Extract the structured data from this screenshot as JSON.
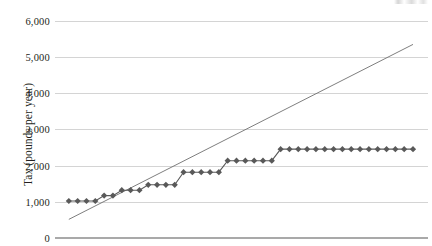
{
  "chart_data": {
    "type": "scatter",
    "title": "",
    "xlabel": "",
    "ylabel": "Tax (pounds per year)",
    "ylim": [
      0,
      6000
    ],
    "xlim": [
      0,
      40
    ],
    "grid": true,
    "legend": "none",
    "y_ticks": [
      "0",
      "1,000",
      "2,000",
      "3,000",
      "4,000",
      "5,000",
      "6,000"
    ],
    "y_tick_values": [
      0,
      1000,
      2000,
      3000,
      4000,
      5000,
      6000
    ],
    "x_ticks": [],
    "series": [
      {
        "name": "Tax paid (stepped bands)",
        "marker": "diamond",
        "color": "#595959",
        "x": [
          1,
          2,
          3,
          4,
          5,
          6,
          7,
          8,
          9,
          10,
          11,
          12,
          13,
          14,
          15,
          16,
          17,
          18,
          19,
          20,
          21,
          22,
          23,
          24,
          25,
          26,
          27,
          28,
          29,
          30,
          31,
          32,
          33,
          34,
          35,
          36,
          37,
          38,
          39,
          40
        ],
        "values": [
          1000,
          1000,
          1000,
          1000,
          1150,
          1150,
          1300,
          1300,
          1300,
          1450,
          1450,
          1450,
          1450,
          1800,
          1800,
          1800,
          1800,
          1800,
          2120,
          2120,
          2120,
          2120,
          2120,
          2120,
          2440,
          2440,
          2440,
          2440,
          2440,
          2440,
          2440,
          2440,
          2440,
          2440,
          2440,
          2440,
          2440,
          2440,
          2440,
          2440
        ]
      },
      {
        "name": "Reference line",
        "marker": "none",
        "color": "#6f6f6f",
        "x": [
          1,
          40
        ],
        "values": [
          490,
          5350
        ]
      }
    ]
  },
  "axis": {
    "y_title": "Tax (pounds per year)"
  }
}
